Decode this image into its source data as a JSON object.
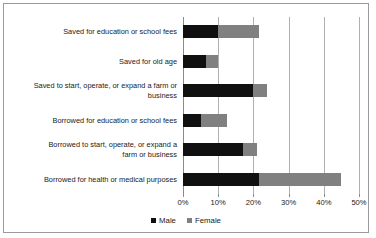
{
  "chart_data": {
    "type": "bar",
    "orientation": "horizontal",
    "stacked": true,
    "title": "",
    "xlabel": "",
    "ylabel": "",
    "xlim": [
      0,
      50
    ],
    "xticks": [
      0,
      10,
      20,
      30,
      40,
      50
    ],
    "xtick_labels": [
      "0%",
      "10%",
      "20%",
      "30%",
      "40%",
      "50%"
    ],
    "grid": true,
    "legend_position": "bottom",
    "categories": [
      "Saved for education or school fees",
      "Saved for old age",
      "Saved to start, operate, or expand a farm or business",
      "Borrowed for education or school fees",
      "Borrowed to start, operate, or expand a farm or business",
      "Borrowed for health or medical purposes"
    ],
    "series": [
      {
        "name": "Male",
        "color": "#101010",
        "values": [
          10.0,
          6.5,
          20.0,
          5.0,
          17.0,
          21.5
        ]
      },
      {
        "name": "Female",
        "color": "#808080",
        "values": [
          11.5,
          3.5,
          4.0,
          7.5,
          4.0,
          23.5
        ]
      }
    ],
    "totals": [
      21.5,
      10.0,
      24.0,
      12.5,
      21.0,
      45.0
    ]
  },
  "legend": {
    "items": [
      {
        "label": "Male",
        "color": "#101010"
      },
      {
        "label": "Female",
        "color": "#808080"
      }
    ]
  },
  "axis": {
    "tick_labels": [
      "0%",
      "10%",
      "20%",
      "30%",
      "40%",
      "50%"
    ]
  },
  "categories": {
    "c0_line0": "Saved for education or school fees",
    "c1_line0": "Saved for old age",
    "c2_line0": "Saved to start, operate, or expand a farm or",
    "c2_line1": "business",
    "c3_line0": "Borrowed for education or school fees",
    "c4_line0": "Borrowed to start, operate, or expand a",
    "c4_line1": "farm or business",
    "c5_line0": "Borrowed for health or medical purposes"
  }
}
